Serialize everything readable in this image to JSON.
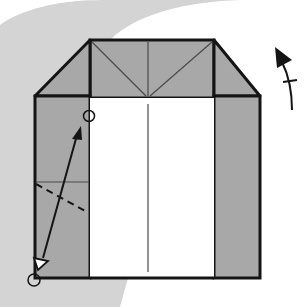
{
  "diagram": {
    "title": "Origami folding step",
    "type": "origami-diagram",
    "colors": {
      "background": "#ffffff",
      "arc_band": "#d4d4d4",
      "paper_colored": "#a8a8a8",
      "paper_white": "#ffffff",
      "stroke": "#141414",
      "crease": "#4a4a4a"
    },
    "elements": {
      "top_band": {
        "label": "top folded band"
      },
      "left_flap": {
        "label": "left triangular flap"
      },
      "right_flap": {
        "label": "right triangular flap"
      },
      "left_column": {
        "label": "left colored strip"
      },
      "right_column": {
        "label": "right colored strip"
      },
      "center_panel": {
        "label": "white center panel"
      },
      "valley_fold_line": {
        "label": "dashed valley fold line"
      },
      "fold_arrow": {
        "label": "fold point to point arrow"
      },
      "reference_point_top": {
        "label": "reference circle top"
      },
      "reference_point_bottom": {
        "label": "reference circle bottom"
      },
      "turn_over_symbol": {
        "label": "turn over / unfold arrow"
      }
    }
  }
}
